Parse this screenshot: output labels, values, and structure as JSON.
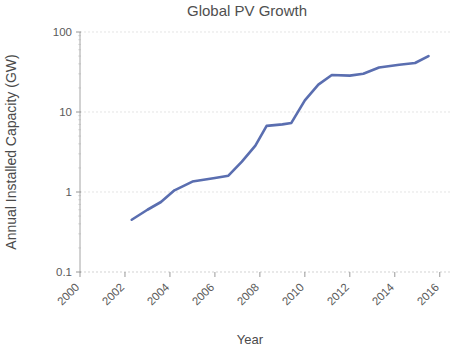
{
  "chart_data": {
    "type": "line",
    "title": "Global PV Growth",
    "xlabel": "Year",
    "ylabel": "Annual Installed Capacity (GW)",
    "yscale": "log",
    "ylim": [
      0.1,
      100
    ],
    "xlim": [
      2000,
      2016.5
    ],
    "grid": true,
    "legend": "none",
    "accent_color": "#5a6eb0",
    "ytick_labels": [
      "100",
      "10",
      "1",
      "0.1"
    ],
    "ytick_values": [
      100,
      10,
      1,
      0.1
    ],
    "xtick_labels": [
      "2000",
      "2002",
      "2004",
      "2006",
      "2008",
      "2010",
      "2012",
      "2014",
      "2016"
    ],
    "xtick_values": [
      2000,
      2002,
      2004,
      2006,
      2008,
      2010,
      2012,
      2014,
      2016
    ],
    "xtick_rotation_deg": 45,
    "series": [
      {
        "name": "Annual Installed Capacity",
        "color": "#5a6eb0",
        "x": [
          2002.3,
          2003.0,
          2003.6,
          2004.2,
          2005.0,
          2006.0,
          2006.6,
          2007.2,
          2007.8,
          2008.3,
          2009.0,
          2009.4,
          2010.0,
          2010.6,
          2011.2,
          2012.0,
          2012.6,
          2013.3,
          2014.2,
          2014.9,
          2015.5
        ],
        "y": [
          0.45,
          0.6,
          0.75,
          1.05,
          1.35,
          1.5,
          1.6,
          2.4,
          3.8,
          6.7,
          7.0,
          7.3,
          14.0,
          22.0,
          29.0,
          28.5,
          30.0,
          36.0,
          39.0,
          41.0,
          50.0
        ]
      }
    ]
  }
}
